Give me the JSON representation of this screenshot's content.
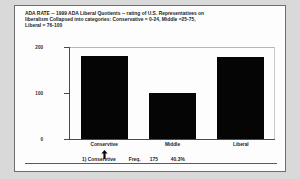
{
  "title": {
    "line1": "ADA RATE -- 1999 ADA Liberal Quotients -- rating of U.S. Representatives on",
    "line2": "liberalism Collapsed into categories: Conservative = 0-24, Middle =25-75,",
    "line3": "Liberal = 76-100"
  },
  "footer": {
    "index_label": "1) Conservtive",
    "freq_label": "Freq.",
    "freq_value": "175",
    "percent": "40.3%"
  },
  "marker": {
    "icon": "up-arrow-cursor-icon",
    "points_at": "Conservtive"
  },
  "colors": {
    "bar": "#050505",
    "axis": "#4a4a4a",
    "panel_bg": "#fdfdfd",
    "page_bg": "#d9d9d9",
    "frame": "#6e6e6e"
  },
  "chart_data": {
    "type": "bar",
    "title": "ADA RATE -- 1999 ADA Liberal Quotients -- rating of U.S. Representatives on liberalism Collapsed into categories: Conservative = 0-24, Middle =25-75, Liberal = 76-100",
    "xlabel": "",
    "ylabel": "",
    "categories": [
      "Conservtive",
      "Middle",
      "Liberal"
    ],
    "values": [
      180,
      100,
      178
    ],
    "ylim": [
      0,
      200
    ],
    "yticks": [
      0,
      100,
      200
    ],
    "ytick_labels": [
      "0",
      "100",
      "200"
    ],
    "grid": false,
    "legend": false
  }
}
